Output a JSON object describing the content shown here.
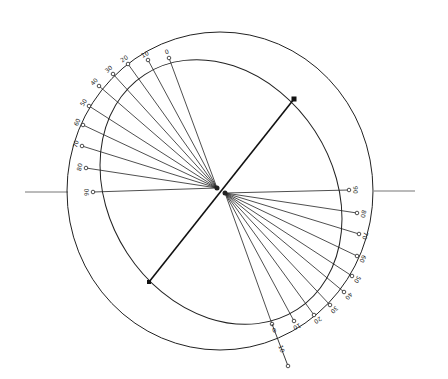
{
  "diagram": {
    "type": "stereographic-construction",
    "stroke_color": "#222222",
    "background": "#ffffff",
    "outer_circle": {
      "cx": 220,
      "cy": 191,
      "rx": 153,
      "ry": 159
    },
    "inner_ellipse": {
      "cx": 221,
      "cy": 192,
      "rx": 112,
      "ry": 140,
      "rotate": -33
    },
    "axis": {
      "x1": 149,
      "y1": 282,
      "x2": 294,
      "y2": 99
    },
    "horizon_left": {
      "x1": 25,
      "y1": 192,
      "x2": 68,
      "y2": 192
    },
    "horizon_right": {
      "x1": 374,
      "y1": 191,
      "x2": 415,
      "y2": 191
    },
    "upper_fan": {
      "origin": [
        217,
        188
      ],
      "rays": [
        {
          "label": "0",
          "x": 169,
          "y": 58
        },
        {
          "label": "10",
          "x": 148,
          "y": 60
        },
        {
          "label": "20",
          "x": 128,
          "y": 64
        },
        {
          "label": "30",
          "x": 113,
          "y": 74
        },
        {
          "label": "40",
          "x": 99,
          "y": 86
        },
        {
          "label": "50",
          "x": 89,
          "y": 106
        },
        {
          "label": "60",
          "x": 83,
          "y": 125
        },
        {
          "label": "70",
          "x": 82,
          "y": 146
        },
        {
          "label": "80",
          "x": 86,
          "y": 168
        },
        {
          "label": "90",
          "x": 93,
          "y": 192
        }
      ]
    },
    "lower_fan": {
      "origin": [
        225,
        193
      ],
      "rays": [
        {
          "label": "90",
          "x": 349,
          "y": 190
        },
        {
          "label": "80",
          "x": 357,
          "y": 213
        },
        {
          "label": "70",
          "x": 359,
          "y": 234
        },
        {
          "label": "60",
          "x": 357,
          "y": 256
        },
        {
          "label": "50",
          "x": 352,
          "y": 276
        },
        {
          "label": "40",
          "x": 344,
          "y": 292
        },
        {
          "label": "30",
          "x": 330,
          "y": 305
        },
        {
          "label": "20",
          "x": 314,
          "y": 315
        },
        {
          "label": "10",
          "x": 294,
          "y": 321
        },
        {
          "label": "0",
          "x": 272,
          "y": 324
        }
      ]
    },
    "extension": {
      "x1": 272,
      "y1": 324,
      "x2": 288,
      "y2": 366,
      "label": "10",
      "label_x": 281,
      "label_y": 349,
      "end_marker": "4"
    }
  }
}
